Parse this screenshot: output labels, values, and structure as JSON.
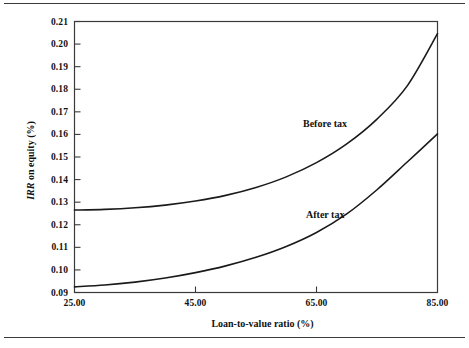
{
  "figure": {
    "has_top_rule": true,
    "has_bottom_rule": true,
    "frame_color": "#3a3a3a",
    "background": "#ffffff"
  },
  "chart_data": {
    "type": "line",
    "title": "",
    "xlabel": "Loan-to-value ratio (%)",
    "ylabel": "IRR on equity (%)",
    "ylabel_italic_part": "IRR",
    "ylabel_rest": " on equity (%)",
    "xlim": [
      25.0,
      85.0
    ],
    "ylim": [
      0.09,
      0.21
    ],
    "xticks": [
      25.0,
      45.0,
      65.0,
      85.0
    ],
    "xtick_labels": [
      "25.00",
      "45.00",
      "65.00",
      "85.00"
    ],
    "yticks": [
      0.09,
      0.1,
      0.11,
      0.12,
      0.13,
      0.14,
      0.15,
      0.16,
      0.17,
      0.18,
      0.19,
      0.2,
      0.21
    ],
    "ytick_labels": [
      "0.09",
      "0.10",
      "0.11",
      "0.12",
      "0.13",
      "0.14",
      "0.15",
      "0.16",
      "0.17",
      "0.18",
      "0.19",
      "0.20",
      "0.21"
    ],
    "grid": false,
    "legend_position": "inline-annotations",
    "line_color": "#1a1a1a",
    "line_width": 1.6,
    "x": [
      25,
      30,
      35,
      40,
      45,
      50,
      55,
      60,
      65,
      70,
      75,
      80,
      85
    ],
    "series": [
      {
        "name": "Before tax",
        "label": "Before tax",
        "annotation_x": 61.0,
        "annotation_y": 0.163,
        "values": [
          0.1265,
          0.1268,
          0.1275,
          0.1287,
          0.1305,
          0.133,
          0.1365,
          0.1412,
          0.1475,
          0.1558,
          0.1668,
          0.1815,
          0.2046
        ]
      },
      {
        "name": "After tax",
        "label": "After tax",
        "annotation_x": 61.5,
        "annotation_y": 0.123,
        "values": [
          0.0925,
          0.0933,
          0.0946,
          0.0964,
          0.0988,
          0.1018,
          0.1056,
          0.1104,
          0.1166,
          0.1248,
          0.1355,
          0.1478,
          0.1602
        ]
      }
    ]
  }
}
